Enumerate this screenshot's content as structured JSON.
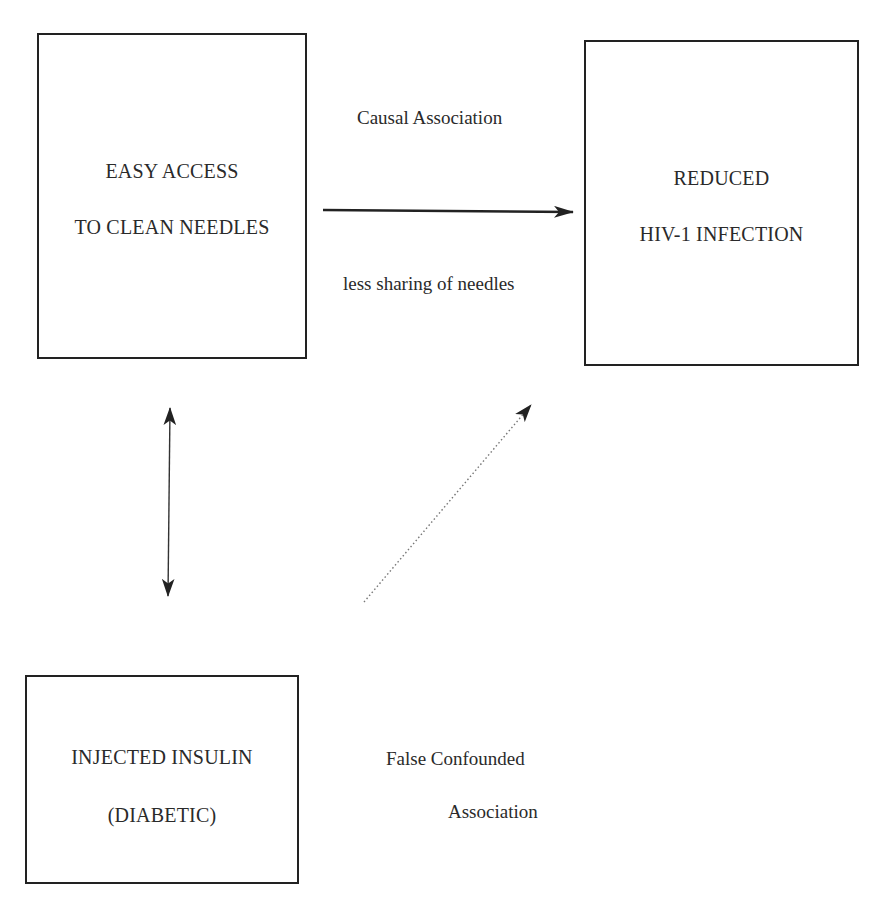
{
  "diagram": {
    "boxes": {
      "exposure": {
        "line1": "EASY ACCESS",
        "line2": "TO CLEAN NEEDLES"
      },
      "outcome": {
        "line1": "REDUCED",
        "line2": "HIV-1 INFECTION"
      },
      "confounder": {
        "line1": "INJECTED INSULIN",
        "line2": "(DIABETIC)"
      }
    },
    "labels": {
      "causal_above": "Causal Association",
      "causal_below": "less sharing of needles",
      "false_line1": "False Confounded",
      "false_line2": "Association"
    },
    "arrows": {
      "causal": {
        "style": "solid",
        "direction": "exposure-to-outcome"
      },
      "confounder_link": {
        "style": "solid",
        "direction": "bidirectional"
      },
      "false_association": {
        "style": "dotted",
        "direction": "confounder-to-outcome"
      }
    },
    "colors": {
      "line": "#222222",
      "text": "#2a2a2a",
      "dotted": "#777777",
      "background": "#ffffff"
    }
  }
}
